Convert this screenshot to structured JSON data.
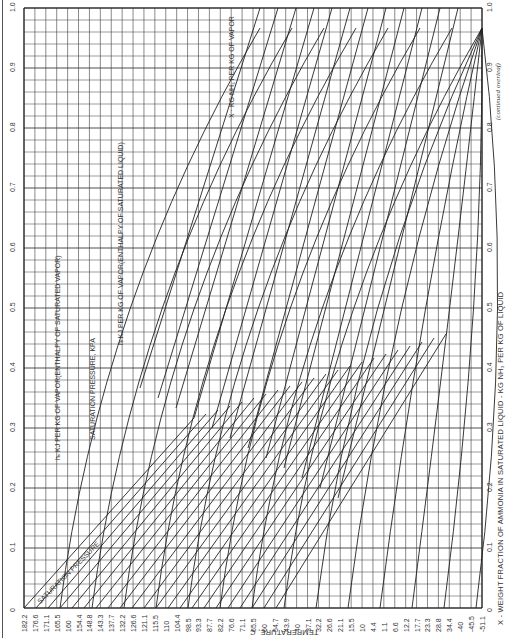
{
  "chart_data": {
    "type": "line",
    "orientation": "rotated -90deg (x-axis runs bottom→top along right edge)",
    "xlabel": "X - WEIGHT FRACTION OF AMMONIA IN SATURATED LIQUID - KG NH3 PER KG OF LIQUID",
    "ylabel": "TEMPERATURE, C",
    "x_ticks": [
      "0",
      "0.1",
      "0.2",
      "0.3",
      "0.4",
      "0.5",
      "0.6",
      "0.7",
      "0.8",
      "0.9",
      "1.0"
    ],
    "xlim": [
      0,
      1.0
    ],
    "temperature_ticks": [
      "182.2",
      "176.6",
      "171.1",
      "165.5",
      "160",
      "154.4",
      "148.8",
      "143.3",
      "137.7",
      "132.2",
      "126.6",
      "121.1",
      "115.5",
      "110",
      "104.4",
      "98.5",
      "93.3",
      "87.7",
      "82.2",
      "76.6",
      "71.1",
      "65.5",
      "60",
      "54.7",
      "43.9",
      "40",
      "37.1",
      "32.2",
      "26.6",
      "21.1",
      "15.5",
      "10",
      "4.4",
      "1.1",
      "6.6",
      "12.2",
      "17.7",
      "23.3",
      "28.8",
      "34.4",
      "-40",
      "-45.5",
      "-51.1"
    ],
    "grid": true,
    "annotations": [
      "SATURATION PRESSURE",
      "SATURATION PRESSURE, KPA",
      "hL KJ PER KG OF VAPOR(ENTHALPY OF SATURATED LIQUID)",
      "hv KJ PER KG OF VAPOR(ENTHALPY OF SATURATED VAPOR)",
      "X KG NH3 PER KG OF VAPOR"
    ],
    "series": [
      {
        "name": "saturation pressure lines (kPa)",
        "labels": [
          "600",
          "700",
          "800",
          "900",
          "1000",
          "1200",
          "1400",
          "1600",
          "2000",
          "2400",
          "2800",
          "3200"
        ]
      },
      {
        "name": "enthalpy of saturated liquid (kJ/kg)",
        "labels": [
          "-92",
          "-23",
          "46",
          "116",
          "186",
          "256",
          "326",
          "395",
          "465",
          "535",
          "605",
          "674",
          "744"
        ]
      },
      {
        "name": "enthalpy of saturated vapor (kJ/kg)",
        "labels": [
          "1163",
          "1279",
          "1396",
          "1512",
          "1628",
          "1744",
          "1861",
          "1977",
          "2093",
          "2209",
          "2326",
          "2442"
        ]
      },
      {
        "name": "vapor composition lines",
        "labels": [
          "0.5",
          "0.6",
          "0.7",
          "0.8",
          "0.9",
          "0.95",
          "0.99"
        ]
      }
    ],
    "footnote": "(continued overleaf)"
  },
  "axis": {
    "top_ticks": [
      "0",
      "0.1",
      "0.2",
      "0.3",
      "0.4",
      "0.5",
      "0.6",
      "0.7",
      "0.8",
      "0.9",
      "1.0"
    ],
    "bottom_ticks": [
      "0",
      "0.1",
      "0.2",
      "0.3",
      "0.4",
      "0.5",
      "0.6",
      "0.7",
      "0.8",
      "0.9",
      "1.0"
    ],
    "x_title": "X - WEIGHT FRACTION OF AMMONIA IN SATURATED LIQUID - KG NH₃ PER KG OF LIQUID",
    "temp_title": "TEMPERATURE, C",
    "temps": [
      "182.2",
      "176.6",
      "171.1",
      "165.5",
      "160",
      "154.4",
      "148.8",
      "143.3",
      "137.7",
      "132.2",
      "126.6",
      "121.1",
      "115.5",
      "110",
      "104.4",
      "98.5",
      "93.3",
      "87.7",
      "82.2",
      "76.6",
      "71.1",
      "65.5",
      "60",
      "54.7",
      "43.9",
      "40",
      "37.1",
      "32.2",
      "26.6",
      "21.1",
      "15.5",
      "10",
      "4.4",
      "1.1",
      "6.6",
      "12.2",
      "17.7",
      "23.3",
      "28.8",
      "34.4",
      "-40",
      "-45.5",
      "-51.1"
    ]
  },
  "labels": {
    "sat_pressure": "SATURATION PRESSURE",
    "sat_pressure_kpa": "SATURATION PRESSURE, KPA",
    "hl": "hₗ  KJ PER KG OF VAPOR(ENTHALPY OF SATURATED LIQUID)",
    "hv": "hᵥ  KJ PER KG OF VAPOR(ENTHALPY OF SATURATED VAPOR)",
    "xv": "X · KG NH₃ PER KG OF VAPOR",
    "continued": "(continued overleaf)"
  },
  "colors": {
    "ink": "#222222",
    "grid": "#3a3a3a",
    "paper": "#ffffff"
  }
}
